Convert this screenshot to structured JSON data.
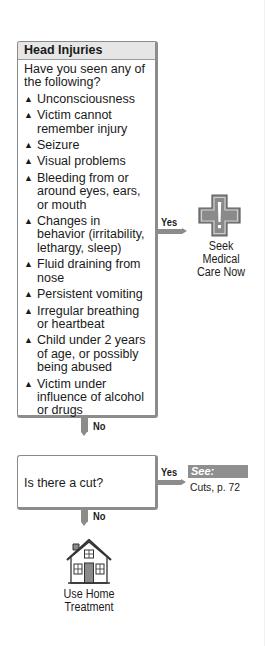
{
  "main_box": {
    "title": "Head Injuries",
    "question": "Have you seen any of the following?",
    "symptoms": [
      "Unconsciousness",
      "Victim cannot remember injury",
      "Seizure",
      "Visual problems",
      "Bleeding from or around eyes, ears, or mouth",
      "Changes in behavior (irritability, lethargy, sleep)",
      "Fluid draining from nose",
      "Persistent vomiting",
      "Irregular breathing or heartbeat",
      "Child under 2 years of age, or possibly being abused",
      "Victim under influence of alcohol or drugs"
    ],
    "bullet_glyph": "▲",
    "yes_label": "Yes",
    "no_label": "No"
  },
  "yes_outcome": {
    "icon": "medical-cross-icon",
    "line1": "Seek Medical",
    "line2": "Care Now"
  },
  "cut_box": {
    "question": "Is there a cut?",
    "yes_label": "Yes",
    "no_label": "No"
  },
  "see_reference": {
    "badge": "See:",
    "text": "Cuts, p. 72"
  },
  "no_outcome": {
    "icon": "house-icon",
    "line1": "Use Home",
    "line2": "Treatment"
  },
  "colors": {
    "connector": "#8c8c8c",
    "header_bg": "#e6e6e6",
    "see_bg": "#8f8f8f"
  }
}
